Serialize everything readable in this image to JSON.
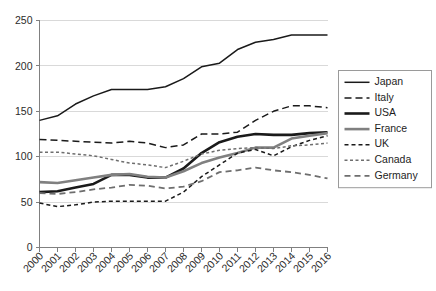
{
  "chart_data": {
    "type": "line",
    "title": "",
    "subtitle": "",
    "xlabel": "",
    "ylabel": "",
    "grid": true,
    "legend_position": "right",
    "x": [
      2000,
      2001,
      2002,
      2003,
      2004,
      2005,
      2006,
      2007,
      2008,
      2009,
      2010,
      2011,
      2012,
      2013,
      2014,
      2015,
      2016
    ],
    "categories": [
      "2000",
      "2001",
      "2002",
      "2003",
      "2004",
      "2005",
      "2006",
      "2007",
      "2008",
      "2009",
      "2010",
      "2011",
      "2012",
      "2013",
      "2014",
      "2015",
      "2016"
    ],
    "ylim": [
      0,
      250
    ],
    "yticks": [
      0,
      50,
      100,
      150,
      200,
      250
    ],
    "ytick_labels": [
      "0",
      "50",
      "100",
      "150",
      "200",
      "250"
    ],
    "series": [
      {
        "name": "Japan",
        "color": "#1a1a1a",
        "width": 1.5,
        "dash": "none",
        "values": [
          140,
          145,
          158,
          167,
          174,
          174,
          174,
          177,
          186,
          199,
          203,
          218,
          226,
          229,
          234,
          234,
          234
        ]
      },
      {
        "name": "Italy",
        "color": "#1a1a1a",
        "width": 1.5,
        "dash": "7,4",
        "values": [
          119,
          118,
          117,
          116,
          115,
          117,
          115,
          110,
          113,
          125,
          125,
          127,
          140,
          150,
          156,
          156,
          154
        ]
      },
      {
        "name": "USA",
        "color": "#1a1a1a",
        "width": 2.6,
        "dash": "none",
        "values": [
          61,
          62,
          66,
          70,
          80,
          80,
          77,
          77,
          87,
          104,
          116,
          122,
          125,
          124,
          124,
          126,
          127
        ]
      },
      {
        "name": "France",
        "color": "#808080",
        "width": 2.6,
        "dash": "none",
        "values": [
          72,
          71,
          74,
          77,
          80,
          81,
          78,
          77,
          84,
          93,
          99,
          104,
          110,
          110,
          120,
          123,
          126
        ]
      },
      {
        "name": "UK",
        "color": "#1a1a1a",
        "width": 1.5,
        "dash": "4,3",
        "values": [
          49,
          45,
          47,
          50,
          51,
          51,
          51,
          51,
          61,
          78,
          91,
          104,
          108,
          101,
          111,
          118,
          123
        ]
      },
      {
        "name": "Canada",
        "color": "#6e6e6e",
        "width": 1.5,
        "dash": "3,2.5",
        "values": [
          105,
          105,
          103,
          101,
          97,
          93,
          91,
          88,
          95,
          103,
          107,
          109,
          110,
          109,
          112,
          113,
          115
        ]
      },
      {
        "name": "Germany",
        "color": "#6e6e6e",
        "width": 1.8,
        "dash": "6,4",
        "values": [
          60,
          59,
          61,
          64,
          66,
          69,
          68,
          65,
          67,
          73,
          83,
          85,
          88,
          85,
          83,
          80,
          76
        ]
      }
    ]
  },
  "legend": {
    "entries": [
      {
        "label": "Japan"
      },
      {
        "label": "Italy"
      },
      {
        "label": "USA"
      },
      {
        "label": "France"
      },
      {
        "label": "UK"
      },
      {
        "label": "Canada"
      },
      {
        "label": "Germany"
      }
    ]
  }
}
